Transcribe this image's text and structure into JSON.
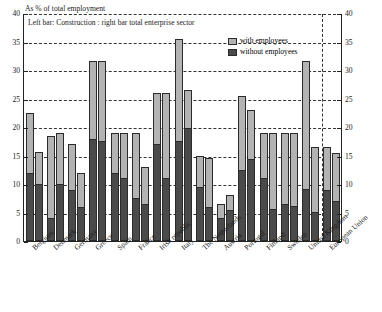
{
  "captions": {
    "top": "As % of total employment",
    "inner": "Left bar: Construction  : right bar total enterprise sector"
  },
  "legend": {
    "items": [
      {
        "label": "with employees",
        "color": "#b3b3b3",
        "key": "with_employees"
      },
      {
        "label": "without employees",
        "color": "#4a4a4a",
        "key": "without_employees"
      }
    ]
  },
  "axis": {
    "y_ticks": [
      "0",
      "5",
      "10",
      "15",
      "20",
      "25",
      "30",
      "35",
      "40"
    ],
    "y_min": 0,
    "y_max": 40
  },
  "chart_data": {
    "type": "bar",
    "title": "As % of total employment",
    "subtitle": "Left bar: Construction  : right bar total enterprise sector",
    "xlabel": "",
    "ylabel": "As % of total employment",
    "ylim": [
      0,
      40
    ],
    "grid": true,
    "legend_position": "top-right",
    "stacked": true,
    "bar_pairs": [
      "Construction",
      "Total enterprise sector"
    ],
    "segments": [
      "without employees",
      "with employees"
    ],
    "categories": [
      "Belgium",
      "Denmark",
      "Germany",
      "Greece",
      "Spain",
      "France",
      "Irish republic",
      "Italy",
      "The Netherlands",
      "Austria",
      "Portugal",
      "Finland",
      "Sweden",
      "United Kingdom",
      "European Union"
    ],
    "series": [
      {
        "name": "Construction - without employees",
        "values": [
          12.0,
          4.0,
          9.0,
          18.0,
          12.0,
          7.5,
          17.0,
          17.5,
          9.5,
          4.0,
          12.5,
          11.0,
          6.5,
          9.0,
          9.0
        ]
      },
      {
        "name": "Construction - with employees",
        "values": [
          10.5,
          14.5,
          8.0,
          13.5,
          7.0,
          11.5,
          9.0,
          18.0,
          5.5,
          2.5,
          13.0,
          8.0,
          12.5,
          22.5,
          7.5
        ]
      },
      {
        "name": "Total enterprise sector - without employees",
        "values": [
          10.0,
          10.0,
          6.0,
          17.5,
          11.0,
          6.5,
          11.0,
          20.0,
          6.0,
          5.5,
          14.5,
          5.5,
          6.0,
          5.0,
          7.0
        ]
      },
      {
        "name": "Total enterprise sector - with employees",
        "values": [
          5.7,
          9.0,
          6.0,
          14.0,
          8.0,
          6.5,
          15.0,
          6.5,
          8.5,
          2.5,
          8.5,
          13.5,
          13.0,
          11.5,
          8.5
        ]
      }
    ],
    "totals": {
      "construction": [
        22.5,
        18.5,
        17.0,
        31.5,
        19.0,
        19.0,
        26.0,
        35.5,
        15.0,
        6.5,
        25.5,
        19.0,
        19.0,
        31.5,
        16.5
      ],
      "total_enterprise_sector": [
        15.7,
        19.0,
        12.0,
        31.5,
        19.0,
        13.0,
        26.0,
        26.5,
        14.5,
        8.0,
        23.0,
        19.0,
        19.0,
        16.5,
        15.5
      ]
    }
  }
}
